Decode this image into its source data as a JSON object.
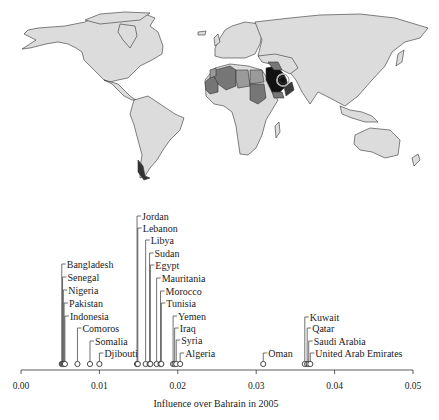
{
  "map": {
    "highlight_country": "Bahrain",
    "colors": {
      "background": "#ffffff",
      "default_fill": "#dcdcdc",
      "border": "#333333",
      "light_gray": "#9a9a9a",
      "medium_gray": "#767676",
      "dark_gray": "#3a3a3a",
      "black": "#111111"
    }
  },
  "chart_data": {
    "type": "scatter",
    "title": "",
    "xlabel": "Influence over Bahrain in 2005",
    "ylabel": "",
    "xlim": [
      0.0,
      0.05
    ],
    "xticks": [
      0.0,
      0.01,
      0.02,
      0.03,
      0.04,
      0.05
    ],
    "xtick_labels": [
      "0.00",
      "0.01",
      "0.02",
      "0.03",
      "0.04",
      "0.05"
    ],
    "grid": false,
    "legend": null,
    "points": [
      {
        "country": "Bangladesh",
        "x": 0.0052
      },
      {
        "country": "Senegal",
        "x": 0.0053
      },
      {
        "country": "Nigeria",
        "x": 0.0054
      },
      {
        "country": "Pakistan",
        "x": 0.0055
      },
      {
        "country": "Indonesia",
        "x": 0.0056
      },
      {
        "country": "Comoros",
        "x": 0.0072
      },
      {
        "country": "Somalia",
        "x": 0.0088
      },
      {
        "country": "Djibouti",
        "x": 0.01
      },
      {
        "country": "Jordan",
        "x": 0.0148
      },
      {
        "country": "Lebanon",
        "x": 0.0149
      },
      {
        "country": "Libya",
        "x": 0.0159
      },
      {
        "country": "Sudan",
        "x": 0.0164
      },
      {
        "country": "Egypt",
        "x": 0.0165
      },
      {
        "country": "Mauritania",
        "x": 0.0173
      },
      {
        "country": "Morocco",
        "x": 0.0178
      },
      {
        "country": "Tunisia",
        "x": 0.0179
      },
      {
        "country": "Yemen",
        "x": 0.0194
      },
      {
        "country": "Iraq",
        "x": 0.0196
      },
      {
        "country": "Syria",
        "x": 0.0198
      },
      {
        "country": "Algeria",
        "x": 0.0203
      },
      {
        "country": "Oman",
        "x": 0.0309
      },
      {
        "country": "Kuwait",
        "x": 0.0362
      },
      {
        "country": "Qatar",
        "x": 0.0365
      },
      {
        "country": "Saudi Arabia",
        "x": 0.0367
      },
      {
        "country": "United Arab Emirates",
        "x": 0.0369
      }
    ]
  },
  "plot": {
    "labels": [
      {
        "text": "Jordan",
        "ty": 16
      },
      {
        "text": "Lebanon",
        "ty": 28
      },
      {
        "text": "Libya",
        "ty": 40
      },
      {
        "text": "Sudan",
        "ty": 53
      },
      {
        "text": "Egypt",
        "ty": 65
      },
      {
        "text": "Mauritania",
        "ty": 78
      },
      {
        "text": "Morocco",
        "ty": 91
      },
      {
        "text": "Tunisia",
        "ty": 103
      },
      {
        "text": "Yemen",
        "ty": 116
      },
      {
        "text": "Iraq",
        "ty": 128
      },
      {
        "text": "Syria",
        "ty": 140
      },
      {
        "text": "Algeria",
        "ty": 153
      },
      {
        "text": "Bangladesh",
        "ty": 64
      },
      {
        "text": "Senegal",
        "ty": 77
      },
      {
        "text": "Nigeria",
        "ty": 90
      },
      {
        "text": "Pakistan",
        "ty": 103
      },
      {
        "text": "Indonesia",
        "ty": 116
      },
      {
        "text": "Comoros",
        "ty": 128
      },
      {
        "text": "Somalia",
        "ty": 141
      },
      {
        "text": "Djibouti",
        "ty": 153
      },
      {
        "text": "Oman",
        "ty": 153
      },
      {
        "text": "Kuwait",
        "ty": 117
      },
      {
        "text": "Qatar",
        "ty": 128
      },
      {
        "text": "Saudi Arabia",
        "ty": 141
      },
      {
        "text": "United Arab Emirates",
        "ty": 153
      }
    ]
  }
}
